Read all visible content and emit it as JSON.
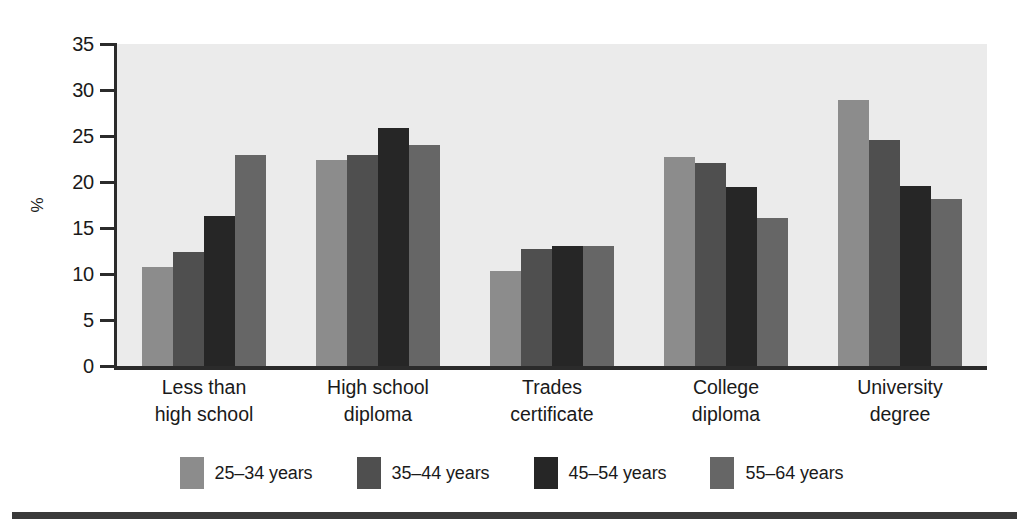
{
  "chart_data": {
    "type": "bar",
    "title": "",
    "xlabel": "",
    "ylabel": "%",
    "ylim": [
      0,
      35
    ],
    "ytick_values": [
      35,
      30,
      25,
      20,
      15,
      10,
      5,
      0
    ],
    "ytick_labels": [
      "35",
      "30",
      "25",
      "20",
      "15",
      "10",
      "5",
      "0"
    ],
    "grid": false,
    "legend_position": "bottom",
    "categories": [
      "Less than high school",
      "High school diploma",
      "Trades certificate",
      "College diploma",
      "University degree"
    ],
    "category_lines": [
      [
        "Less than",
        "high school"
      ],
      [
        "High school",
        "diploma"
      ],
      [
        "Trades",
        "certificate"
      ],
      [
        "College",
        "diploma"
      ],
      [
        "University",
        "degree"
      ]
    ],
    "series": [
      {
        "name": "25–34 years",
        "color": "#8c8c8c",
        "values": [
          10.8,
          22.4,
          10.3,
          22.7,
          28.9
        ]
      },
      {
        "name": "35–44 years",
        "color": "#4f4f4f",
        "values": [
          12.4,
          22.9,
          12.7,
          22.1,
          24.6
        ]
      },
      {
        "name": "45–54 years",
        "color": "#262626",
        "values": [
          16.3,
          25.9,
          13.0,
          19.5,
          19.6
        ]
      },
      {
        "name": "55–64 years",
        "color": "#666666",
        "values": [
          22.9,
          24.0,
          13.0,
          16.1,
          18.2
        ]
      }
    ]
  },
  "style": {
    "plot_background": "#ebebeb",
    "axis_color": "#2b2b2b",
    "rule_color": "#3a3a3a",
    "page_background": "#ffffff"
  }
}
